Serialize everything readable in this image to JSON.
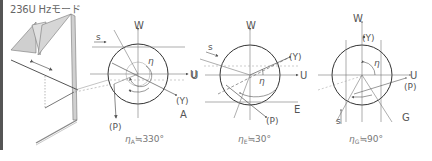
{
  "title": "236U Hzモード",
  "panels": [
    {
      "id": "A",
      "letter": "A",
      "center": [
        138,
        74
      ],
      "radius": 30,
      "labels": {
        "w": "W",
        "u": "U",
        "y": "(Y)",
        "p": "(P)",
        "s": "s",
        "eta": "η"
      },
      "caption": "η",
      "caption_sub": "A",
      "caption_val": "≒330°"
    },
    {
      "id": "E",
      "letter": "E",
      "center": [
        250,
        75
      ],
      "radius": 30,
      "labels": {
        "w": "W",
        "u": "U",
        "u_left": "U",
        "y": "(Y)",
        "p": "(P)",
        "s": "s",
        "eta": "η"
      },
      "caption": "η",
      "caption_sub": "E",
      "caption_val": "≒30°"
    },
    {
      "id": "G",
      "letter": "G",
      "center": [
        362,
        75
      ],
      "radius": 30,
      "labels": {
        "w": "W",
        "u": "U",
        "y": "(Y)",
        "p": "(P)",
        "s": "s",
        "eta": "η"
      },
      "caption": "η",
      "caption_sub": "G",
      "caption_val": "≒90°"
    }
  ],
  "colors": {
    "line": "#555555",
    "light": "#888888",
    "fill": "#cccccc",
    "circle": "#333333"
  }
}
